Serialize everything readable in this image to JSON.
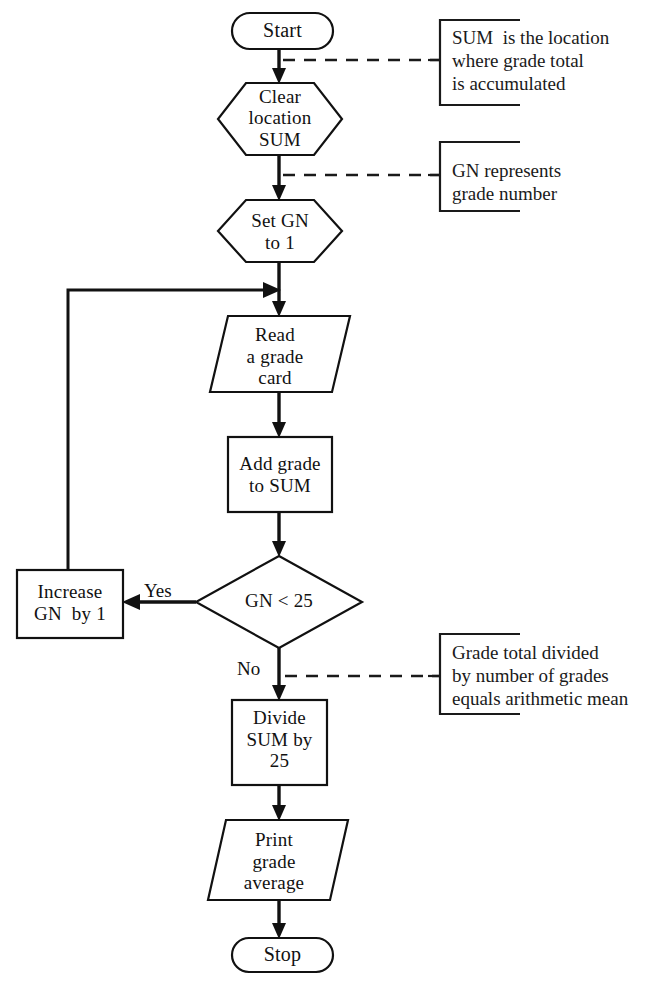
{
  "diagram": {
    "stroke_color": "#111111",
    "background_color": "#ffffff",
    "nodes": [
      {
        "id": "start",
        "shape": "terminator",
        "label": "Start"
      },
      {
        "id": "clear_sum",
        "shape": "hexagon",
        "label": "Clear\nlocation\nSUM"
      },
      {
        "id": "set_gn",
        "shape": "hexagon",
        "label": "Set GN\nto 1"
      },
      {
        "id": "read",
        "shape": "parallelogram",
        "label": "Read\na grade\ncard"
      },
      {
        "id": "add",
        "shape": "process",
        "label": "Add grade\nto SUM"
      },
      {
        "id": "decision",
        "shape": "diamond",
        "label": "GN < 25"
      },
      {
        "id": "increase",
        "shape": "process",
        "label": "Increase\nGN  by 1"
      },
      {
        "id": "divide",
        "shape": "process",
        "label": "Divide\nSUM by\n25"
      },
      {
        "id": "print",
        "shape": "parallelogram",
        "label": "Print\ngrade\naverage"
      },
      {
        "id": "stop",
        "shape": "terminator",
        "label": "Stop"
      }
    ],
    "branch_labels": [
      {
        "id": "yes",
        "label": "Yes"
      },
      {
        "id": "no",
        "label": "No"
      }
    ],
    "annotations": [
      {
        "id": "note-sum",
        "text": "SUM  is the location\nwhere grade total\nis accumulated"
      },
      {
        "id": "note-gn",
        "text": "GN represents\ngrade number"
      },
      {
        "id": "note-mean",
        "text": "Grade total divided\nby number of grades\nequals arithmetic mean"
      }
    ]
  }
}
